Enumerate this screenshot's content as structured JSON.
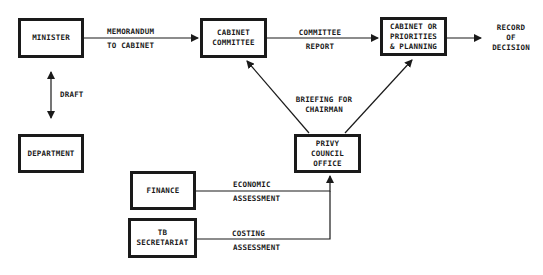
{
  "diagram": {
    "nodes": {
      "minister": {
        "lines": [
          "MINISTER"
        ]
      },
      "cabinet_committee": {
        "lines": [
          "CABINET",
          "COMMITTEE"
        ]
      },
      "cabinet_priorities": {
        "lines": [
          "CABINET OR",
          "PRIORITIES",
          "& PLANNING"
        ]
      },
      "department": {
        "lines": [
          "DEPARTMENT"
        ]
      },
      "privy_council": {
        "lines": [
          "PRIVY",
          "COUNCIL",
          "OFFICE"
        ]
      },
      "finance": {
        "lines": [
          "FINANCE"
        ]
      },
      "tb_secretariat": {
        "lines": [
          "TB",
          "SECRETARIAT"
        ]
      }
    },
    "terminal": {
      "lines": [
        "RECORD",
        "OF",
        "DECISION"
      ]
    },
    "edge_labels": {
      "memorandum": {
        "line1": "MEMORANDUM",
        "line2": "TO CABINET"
      },
      "committee_report": {
        "line1": "COMMITTEE",
        "line2": "REPORT"
      },
      "draft": {
        "line1": "DRAFT"
      },
      "briefing": {
        "line1": "BRIEFING FOR",
        "line2": "CHAIRMAN"
      },
      "economic": {
        "line1": "ECONOMIC",
        "line2": "ASSESSMENT"
      },
      "costing": {
        "line1": "COSTING",
        "line2": "ASSESSMENT"
      }
    },
    "edges": [
      {
        "from": "minister",
        "to": "cabinet_committee",
        "label": "MEMORANDUM TO CABINET"
      },
      {
        "from": "cabinet_committee",
        "to": "cabinet_priorities",
        "label": "COMMITTEE REPORT"
      },
      {
        "from": "cabinet_priorities",
        "to": "record_of_decision",
        "label": ""
      },
      {
        "from": "minister",
        "to": "department",
        "label": "DRAFT",
        "bidirectional": true
      },
      {
        "from": "privy_council",
        "to": "cabinet_committee",
        "label": "BRIEFING FOR CHAIRMAN"
      },
      {
        "from": "privy_council",
        "to": "cabinet_priorities",
        "label": ""
      },
      {
        "from": "finance",
        "to": "privy_council",
        "label": "ECONOMIC ASSESSMENT"
      },
      {
        "from": "tb_secretariat",
        "to": "privy_council",
        "label": "COSTING ASSESSMENT"
      }
    ],
    "colors": {
      "ink": "#1a1a1a",
      "background": "#ffffff"
    }
  }
}
